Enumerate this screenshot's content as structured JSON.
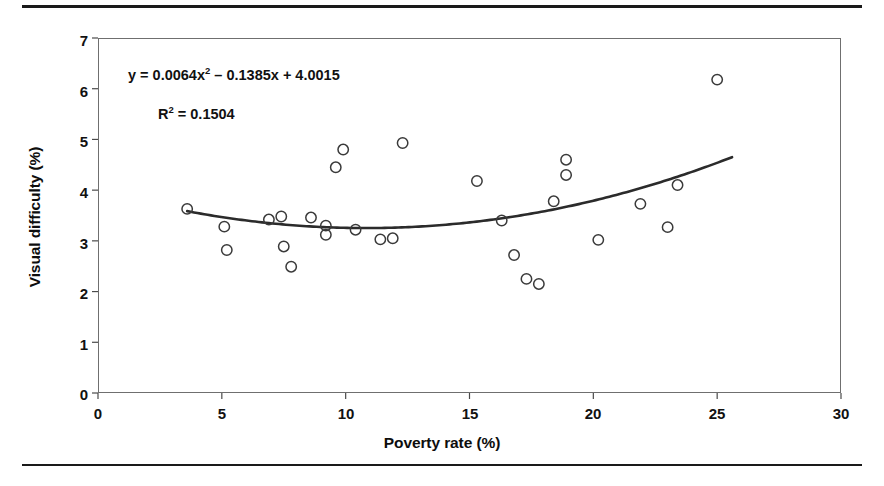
{
  "chart_data": {
    "type": "scatter",
    "title": "",
    "xlabel": "Poverty rate (%)",
    "ylabel": "Visual difficulty (%)",
    "xlim": [
      0,
      30
    ],
    "ylim": [
      0,
      7
    ],
    "xticks": [
      0,
      5,
      10,
      15,
      20,
      25,
      30
    ],
    "yticks": [
      0,
      1,
      2,
      3,
      4,
      5,
      6,
      7
    ],
    "xtick_labels": [
      "0",
      "5",
      "10",
      "15",
      "20",
      "25",
      "30"
    ],
    "ytick_labels": [
      "0",
      "1",
      "2",
      "3",
      "4",
      "5",
      "6",
      "7"
    ],
    "grid": false,
    "legend": null,
    "marker": "open-circle",
    "points": [
      {
        "x": 3.6,
        "y": 3.63
      },
      {
        "x": 5.1,
        "y": 3.28
      },
      {
        "x": 5.2,
        "y": 2.82
      },
      {
        "x": 6.9,
        "y": 3.42
      },
      {
        "x": 7.4,
        "y": 3.48
      },
      {
        "x": 7.5,
        "y": 2.89
      },
      {
        "x": 7.8,
        "y": 2.49
      },
      {
        "x": 8.6,
        "y": 3.46
      },
      {
        "x": 9.2,
        "y": 3.3
      },
      {
        "x": 9.2,
        "y": 3.12
      },
      {
        "x": 9.6,
        "y": 4.45
      },
      {
        "x": 9.9,
        "y": 4.8
      },
      {
        "x": 10.4,
        "y": 3.22
      },
      {
        "x": 11.4,
        "y": 3.03
      },
      {
        "x": 11.9,
        "y": 3.05
      },
      {
        "x": 12.3,
        "y": 4.93
      },
      {
        "x": 15.3,
        "y": 4.18
      },
      {
        "x": 16.3,
        "y": 3.4
      },
      {
        "x": 16.8,
        "y": 2.72
      },
      {
        "x": 17.3,
        "y": 2.25
      },
      {
        "x": 17.8,
        "y": 2.15
      },
      {
        "x": 18.4,
        "y": 3.78
      },
      {
        "x": 18.9,
        "y": 4.6
      },
      {
        "x": 18.9,
        "y": 4.3
      },
      {
        "x": 20.2,
        "y": 3.02
      },
      {
        "x": 21.9,
        "y": 3.73
      },
      {
        "x": 23.0,
        "y": 3.27
      },
      {
        "x": 23.4,
        "y": 4.1
      },
      {
        "x": 25.0,
        "y": 6.18
      }
    ],
    "trendline": {
      "type": "polynomial",
      "degree": 2,
      "coefficients": {
        "a": 0.0064,
        "b": -0.1385,
        "c": 4.0015
      },
      "x_start": 3.6,
      "x_end": 25.6,
      "color": "#2b2b2b"
    },
    "annotations": {
      "equation_prefix": "y = 0.0064x",
      "equation_exponent": "2",
      "equation_suffix": " – 0.1385x + 4.0015",
      "r_squared_prefix": "R",
      "r_squared_exponent": "2",
      "r_squared_suffix": " = 0.1504"
    }
  },
  "figure": {
    "axis_title_x": "Poverty rate (%)",
    "axis_title_y": "Visual difficulty (%)"
  }
}
